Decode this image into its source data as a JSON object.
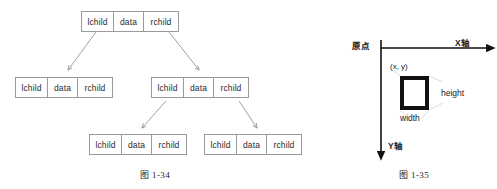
{
  "figure_tree": {
    "caption": "图 1-34",
    "node_fields": {
      "lchild": "lchild",
      "data": "data",
      "rchild": "rchild"
    },
    "nodes": [
      {
        "id": "root",
        "lchild": "lchild",
        "data": "data",
        "rchild": "rchild"
      },
      {
        "id": "left",
        "lchild": "lchild",
        "data": "data",
        "rchild": "rchild"
      },
      {
        "id": "right",
        "lchild": "lchild",
        "data": "data",
        "rchild": "rchild"
      },
      {
        "id": "right-left",
        "lchild": "lchild",
        "data": "data",
        "rchild": "rchild"
      },
      {
        "id": "right-right",
        "lchild": "lchild",
        "data": "data",
        "rchild": "rchild"
      }
    ],
    "edges": [
      {
        "from": "root",
        "via": "lchild",
        "to": "left"
      },
      {
        "from": "root",
        "via": "rchild",
        "to": "right"
      },
      {
        "from": "right",
        "via": "lchild",
        "to": "right-left"
      },
      {
        "from": "right",
        "via": "rchild",
        "to": "right-right"
      }
    ]
  },
  "figure_coords": {
    "caption": "图 1-35",
    "origin_label": "原点",
    "x_axis_label": "X轴",
    "y_axis_label": "Y轴",
    "point_label": "(x, y)",
    "height_label": "height",
    "width_label": "width"
  },
  "colors": {
    "box_border": "#9a9a9a",
    "arrow": "#8f8f8f",
    "axis": "#111111",
    "rect_border": "#111111",
    "leader": "#cfcfcf",
    "text": "#2b2b2b",
    "background": "#ffffff"
  }
}
